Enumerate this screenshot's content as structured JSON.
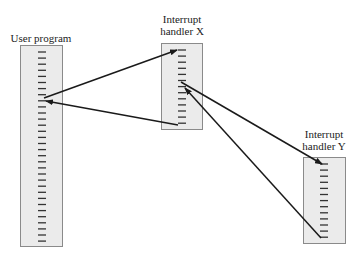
{
  "diagram": {
    "title": "",
    "nodes": [
      {
        "id": "user",
        "label": "User program",
        "x": 20,
        "y": 45,
        "w": 43,
        "h": 202,
        "dash_start_y": 52,
        "dash_count": 32,
        "dash_spacing": 6.1,
        "dash_x1": 38,
        "dash_x2": 46
      },
      {
        "id": "hx",
        "label_line1": "Interrupt",
        "label_line2": "handler X",
        "x": 161,
        "y": 43,
        "w": 42,
        "h": 87,
        "dash_start_y": 50,
        "dash_count": 13,
        "dash_spacing": 6.1,
        "dash_x1": 178,
        "dash_x2": 186
      },
      {
        "id": "hy",
        "label_line1": "Interrupt",
        "label_line2": "handler Y",
        "x": 303,
        "y": 157,
        "w": 43,
        "h": 87,
        "dash_start_y": 164,
        "dash_count": 13,
        "dash_spacing": 6.1,
        "dash_x1": 320,
        "dash_x2": 328
      }
    ],
    "edges": [
      {
        "from": "user",
        "to": "hx",
        "x1": 44,
        "y1": 98,
        "x2": 177,
        "y2": 50,
        "arrow": "end"
      },
      {
        "from": "hx",
        "to": "user",
        "x1": 178,
        "y1": 125,
        "x2": 46,
        "y2": 101,
        "arrow": "end"
      },
      {
        "from": "hx",
        "to": "hy",
        "x1": 181,
        "y1": 82,
        "x2": 322,
        "y2": 164,
        "arrow": "end"
      },
      {
        "from": "hy",
        "to": "hx",
        "x1": 321,
        "y1": 238,
        "x2": 185,
        "y2": 88,
        "arrow": "end"
      }
    ],
    "colors": {
      "box_fill": "#ebebeb",
      "box_border": "#8a8a8a",
      "dash": "#333333",
      "arrow": "#1a1a1a"
    }
  }
}
